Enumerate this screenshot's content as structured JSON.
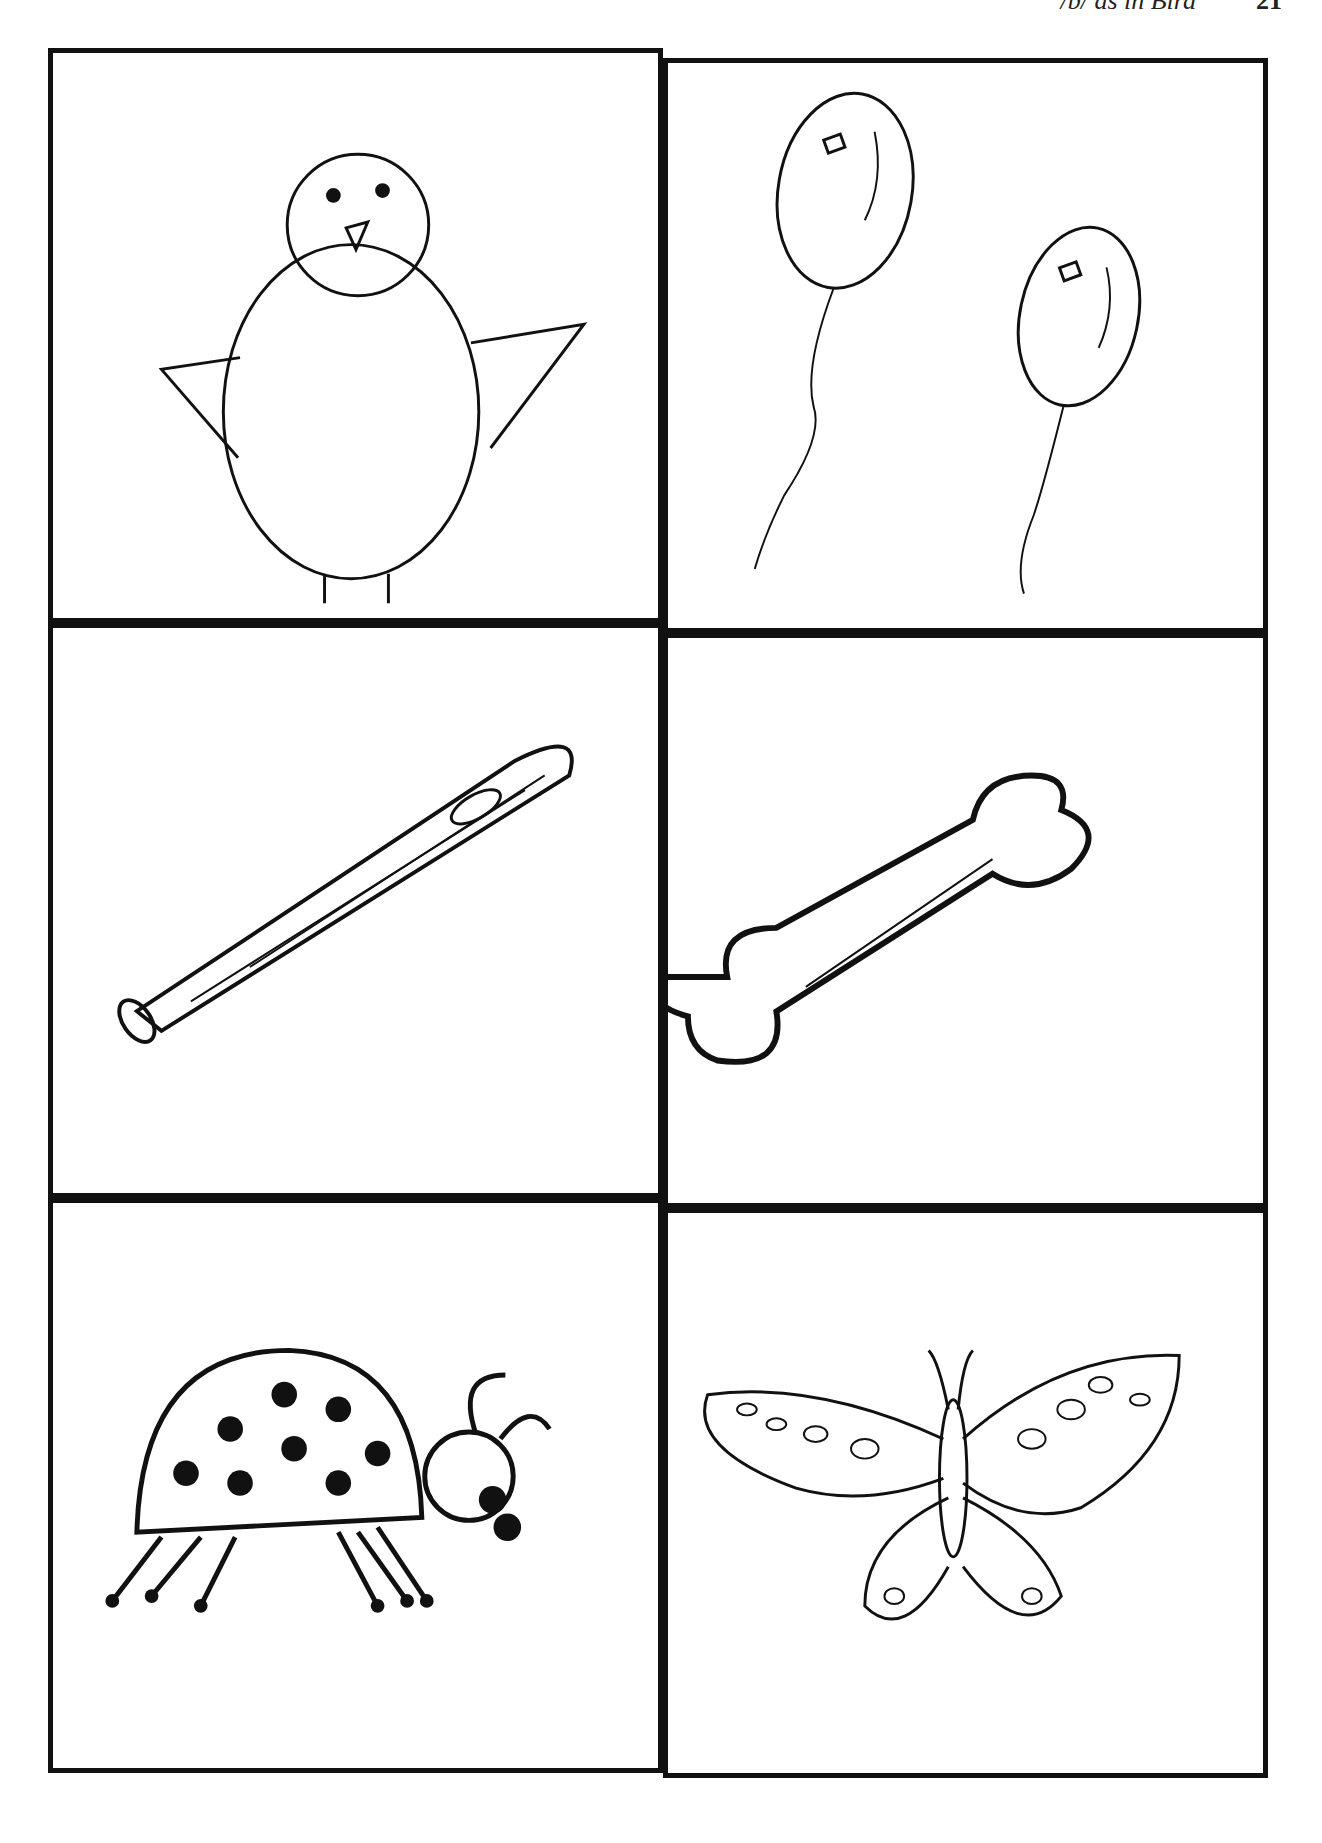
{
  "header": {
    "title": "/b/ as in Bird",
    "page_number": "21"
  },
  "cards": [
    {
      "name": "bird",
      "label": "bird"
    },
    {
      "name": "balloons",
      "label": "balloons"
    },
    {
      "name": "bat",
      "label": "bat"
    },
    {
      "name": "bone",
      "label": "bone"
    },
    {
      "name": "bug",
      "label": "bug"
    },
    {
      "name": "butterfly",
      "label": "butterfly"
    }
  ]
}
